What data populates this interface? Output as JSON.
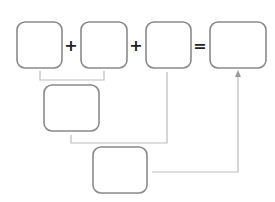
{
  "diagram": {
    "boxes": [
      {
        "id": "addend-1",
        "label": ""
      },
      {
        "id": "addend-2",
        "label": ""
      },
      {
        "id": "addend-3",
        "label": ""
      },
      {
        "id": "sum",
        "label": ""
      },
      {
        "id": "partial-sum",
        "label": ""
      },
      {
        "id": "combined",
        "label": ""
      }
    ],
    "operators": {
      "plus_1": "+",
      "plus_2": "+",
      "equals": "="
    },
    "colors": {
      "box_stroke": "#8a8a8a",
      "connector": "#bdbdbd",
      "operator": "#222222"
    }
  }
}
